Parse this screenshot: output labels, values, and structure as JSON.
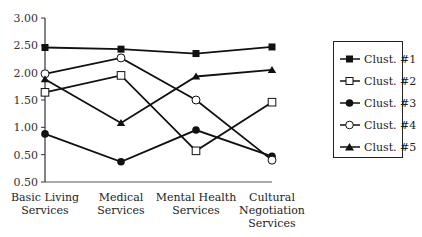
{
  "chart_data": {
    "type": "line",
    "title": "",
    "xlabel": "",
    "ylabel": "",
    "categories": [
      [
        "Basic Living",
        "Services"
      ],
      [
        "Medical",
        "Services"
      ],
      [
        "Mental Health",
        "Services"
      ],
      [
        "Cultural",
        "Negotiation",
        "Services"
      ]
    ],
    "y_ticks": [
      {
        "value": 3.0,
        "label": "3.00"
      },
      {
        "value": 2.5,
        "label": "2.50"
      },
      {
        "value": 2.0,
        "label": "2.00"
      },
      {
        "value": 1.5,
        "label": "1.50"
      },
      {
        "value": 1.0,
        "label": "1.00"
      },
      {
        "value": 0.5,
        "label": "0.50"
      },
      {
        "value": 0.0,
        "label": "0.50"
      }
    ],
    "ylim": [
      0,
      3
    ],
    "grid": false,
    "legend_position": "right",
    "series": [
      {
        "name": "Clust. #1",
        "marker": "square-filled",
        "values": [
          2.46,
          2.43,
          2.35,
          2.47
        ]
      },
      {
        "name": "Clust. #2",
        "marker": "square-open",
        "values": [
          1.64,
          1.95,
          0.57,
          1.46
        ]
      },
      {
        "name": "Clust. #3",
        "marker": "circle-filled",
        "values": [
          0.88,
          0.37,
          0.95,
          0.47
        ]
      },
      {
        "name": "Clust. #4",
        "marker": "circle-open",
        "values": [
          1.98,
          2.27,
          1.5,
          0.4
        ]
      },
      {
        "name": "Clust. #5",
        "marker": "triangle-filled",
        "values": [
          1.88,
          1.08,
          1.93,
          2.05
        ]
      }
    ]
  },
  "legend": {
    "items": [
      "Clust. #1",
      "Clust. #2",
      "Clust. #3",
      "Clust. #4",
      "Clust. #5"
    ]
  }
}
